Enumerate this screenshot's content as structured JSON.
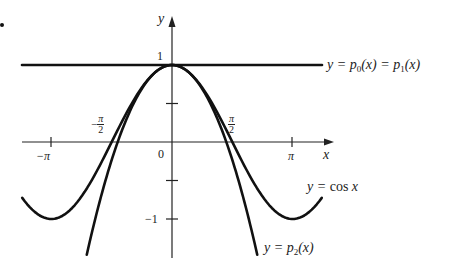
{
  "chart_data": {
    "type": "line",
    "title": "",
    "xlabel": "x",
    "ylabel": "y",
    "xlim": [
      -4.0,
      4.2
    ],
    "ylim": [
      -1.5,
      1.6
    ],
    "grid": false,
    "x_ticks": [
      {
        "value": -3.14159,
        "label": "−π"
      },
      {
        "value": -1.5708,
        "label": "−π/2"
      },
      {
        "value": 0,
        "label": "0"
      },
      {
        "value": 1.5708,
        "label": "π/2"
      },
      {
        "value": 3.14159,
        "label": "π"
      }
    ],
    "y_ticks": [
      {
        "value": 1,
        "label": "1"
      },
      {
        "value": 0.5,
        "label": ""
      },
      {
        "value": -0.5,
        "label": ""
      },
      {
        "value": -1,
        "label": "−1"
      }
    ],
    "series": [
      {
        "name": "y = p0(x) = p1(x)",
        "formula": "1",
        "x_range": [
          -3.9,
          4.0
        ],
        "values_sample": [
          {
            "x": -3.9,
            "y": 1
          },
          {
            "x": 0,
            "y": 1
          },
          {
            "x": 4.0,
            "y": 1
          }
        ]
      },
      {
        "name": "y = cos x",
        "formula": "cos(x)",
        "x_range": [
          -3.9,
          3.9
        ],
        "values_sample": [
          {
            "x": -3.9,
            "y": -0.73
          },
          {
            "x": -3.14,
            "y": -1
          },
          {
            "x": -1.57,
            "y": 0
          },
          {
            "x": 0,
            "y": 1
          },
          {
            "x": 1.57,
            "y": 0
          },
          {
            "x": 3.14,
            "y": -1
          },
          {
            "x": 3.9,
            "y": -0.73
          }
        ]
      },
      {
        "name": "y = p2(x)",
        "formula": "1 - x^2/2",
        "x_range": [
          -2.22,
          2.22
        ],
        "values_sample": [
          {
            "x": -2.22,
            "y": -1.46
          },
          {
            "x": -1.41,
            "y": 0
          },
          {
            "x": 0,
            "y": 1
          },
          {
            "x": 1.41,
            "y": 0
          },
          {
            "x": 2.22,
            "y": -1.46
          }
        ]
      }
    ],
    "annotations": [
      "y = p0(x) = p1(x)",
      "y = cos x",
      "y = p2(x)"
    ],
    "legend_position": "inline-right"
  },
  "labels": {
    "y_axis": "y",
    "x_axis": "x",
    "one": "1",
    "zero": "0",
    "minus_one": "−1",
    "minus_pi": "−π",
    "pi": "π",
    "pi_sym": "π",
    "two": "2",
    "minus_sign": "−",
    "p01_prefix": "y = ",
    "p0": "p",
    "p0_sub": "0",
    "p01_mid": "(x) = ",
    "p1": "p",
    "p1_sub": "1",
    "p01_end": "(x)",
    "cos_prefix": "y = ",
    "cos_text": "cos ",
    "cos_x": "x",
    "p2_prefix": "y = ",
    "p2": "p",
    "p2_sub": "2",
    "p2_end": "(x)"
  },
  "geometry": {
    "origin_px": [
      172,
      142
    ],
    "px_per_unit_x": 38.4,
    "px_per_unit_y": 77
  }
}
